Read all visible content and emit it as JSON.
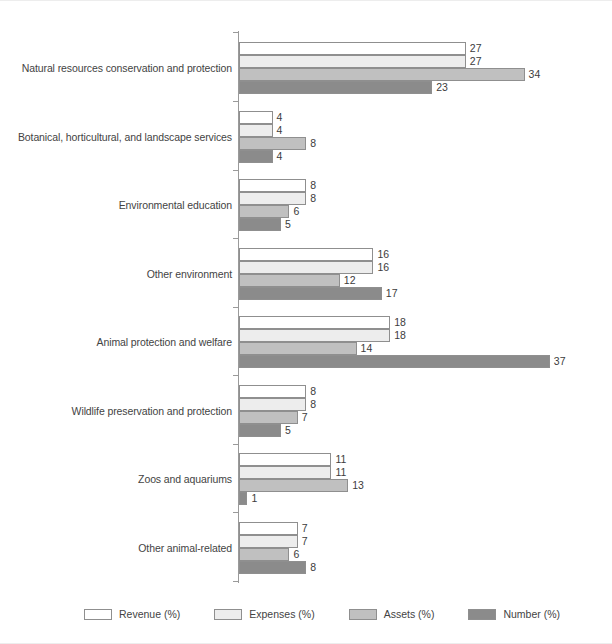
{
  "chart_data": {
    "type": "bar",
    "orientation": "horizontal",
    "title": "",
    "subtitle": "",
    "xlabel": "",
    "ylabel": "",
    "grid": false,
    "legend_position": "bottom-left",
    "xlim": [
      0,
      40
    ],
    "categories": [
      "Natural resources conservation and protection",
      "Botanical, horticultural, and landscape services",
      "Environmental education",
      "Other environment",
      "Animal protection and welfare",
      "Wildlife preservation and protection",
      "Zoos and aquariums",
      "Other animal-related"
    ],
    "series": [
      {
        "name": "Revenue (%)",
        "color": "#ffffff",
        "values": [
          27,
          4,
          8,
          16,
          18,
          8,
          11,
          7
        ]
      },
      {
        "name": "Expenses (%)",
        "color": "#ededed",
        "values": [
          27,
          4,
          8,
          16,
          18,
          8,
          11,
          7
        ]
      },
      {
        "name": "Assets (%)",
        "color": "#c0c0c0",
        "values": [
          34,
          8,
          6,
          12,
          14,
          7,
          13,
          6
        ]
      },
      {
        "name": "Number (%)",
        "color": "#8b8b8b",
        "values": [
          23,
          4,
          5,
          17,
          37,
          5,
          1,
          8
        ]
      }
    ]
  },
  "legend": {
    "items": [
      {
        "label": "Revenue (%)"
      },
      {
        "label": "Expenses (%)"
      },
      {
        "label": "Assets (%)"
      },
      {
        "label": "Number (%)"
      }
    ]
  },
  "axis": {
    "bar_color_outline": "#8f8f8f",
    "axis_color": "#9a9a9a"
  }
}
